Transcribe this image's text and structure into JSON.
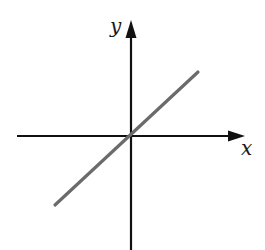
{
  "diagram": {
    "type": "coordinate-axes-with-line",
    "axes": {
      "x_label": "x",
      "y_label": "y",
      "origin_px": [
        131,
        136
      ],
      "x_axis_px": {
        "from": [
          17,
          136
        ],
        "to": [
          245,
          136
        ]
      },
      "y_axis_px": {
        "from": [
          131,
          250
        ],
        "to": [
          131,
          20
        ]
      },
      "color": "#111111"
    },
    "line": {
      "description": "straight line through origin with positive slope",
      "from_px": [
        55,
        205
      ],
      "to_px": [
        198,
        72
      ],
      "color": "#6b6b6b"
    }
  }
}
